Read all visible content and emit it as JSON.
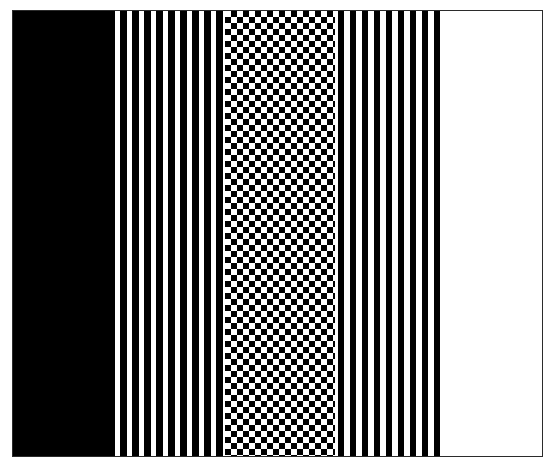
{
  "figure": {
    "kind": "halftone-step-wedge",
    "orientation": "horizontal-left-to-right",
    "background_color": "#ffffff",
    "border_color": "#2b2b2b",
    "ink_color": "#000000",
    "paper_color": "#ffffff",
    "plate": {
      "x": 12,
      "y": 10,
      "width": 531,
      "height": 447,
      "border_width_px": 1
    }
  },
  "chart_data": {
    "type": "bar",
    "title": "",
    "subtitle": "",
    "xlabel": "",
    "ylabel": "",
    "grid": false,
    "legend": false,
    "categories": [
      "Zone 1",
      "Zone 2",
      "Zone 3",
      "Zone 4",
      "Zone 5"
    ],
    "values": [
      100,
      83,
      50,
      25,
      0
    ],
    "ylim": [
      0,
      100
    ],
    "bands": [
      {
        "index": 1,
        "name": "solid-black",
        "ink_percent": 100,
        "pattern": "solid",
        "cell_pitch_px": 0,
        "dot_size_px": 0,
        "dot_color": "#000000",
        "field_color": "#000000",
        "x_start": 0,
        "x_end": 99,
        "width_px": 99
      },
      {
        "index": 2,
        "name": "dense-dark-halftone",
        "ink_percent": 83,
        "pattern": "white-holes-on-black",
        "cell_pitch_px": 12,
        "dot_size_px": 5,
        "dot_color": "#ffffff",
        "field_color": "#000000",
        "x_start": 99,
        "x_end": 212,
        "width_px": 113
      },
      {
        "index": 3,
        "name": "checkerboard-50",
        "ink_percent": 50,
        "pattern": "checkerboard",
        "cell_pitch_px": 6,
        "dot_size_px": 6,
        "dot_color": "#000000",
        "field_color": "#ffffff",
        "x_start": 212,
        "x_end": 322,
        "width_px": 110
      },
      {
        "index": 4,
        "name": "sparse-dark-halftone",
        "ink_percent": 25,
        "pattern": "black-dots-on-white",
        "cell_pitch_px": 12,
        "dot_size_px": 6,
        "dot_color": "#000000",
        "field_color": "#ffffff",
        "x_start": 322,
        "x_end": 432,
        "width_px": 110
      },
      {
        "index": 5,
        "name": "solid-white",
        "ink_percent": 0,
        "pattern": "solid",
        "cell_pitch_px": 0,
        "dot_size_px": 0,
        "dot_color": "#ffffff",
        "field_color": "#ffffff",
        "x_start": 432,
        "x_end": 529,
        "width_px": 97
      }
    ]
  }
}
